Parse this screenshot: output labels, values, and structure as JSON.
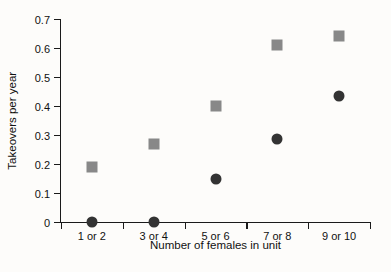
{
  "chart_data": {
    "type": "scatter",
    "title": "",
    "xlabel": "Number of females in unit",
    "ylabel": "Takeovers per year",
    "categories": [
      "1 or 2",
      "3 or 4",
      "5 or 6",
      "7 or 8",
      "9 or 10"
    ],
    "ylim": [
      0,
      0.7
    ],
    "ytick_labels": [
      "0.7",
      "0.6",
      "0.5",
      "0.4",
      "0.3",
      "0.2",
      "0.1",
      "0"
    ],
    "ytick_values": [
      0.7,
      0.6,
      0.5,
      0.4,
      0.3,
      0.2,
      0.1,
      0
    ],
    "grid": false,
    "legend_position": "none",
    "series": [
      {
        "name": "squares",
        "marker": "square",
        "color": "#888888",
        "values": [
          0.19,
          0.27,
          0.4,
          0.61,
          0.64
        ]
      },
      {
        "name": "circles",
        "marker": "circle",
        "color": "#333333",
        "values": [
          0,
          0,
          0.15,
          0.285,
          0.435
        ]
      }
    ]
  }
}
